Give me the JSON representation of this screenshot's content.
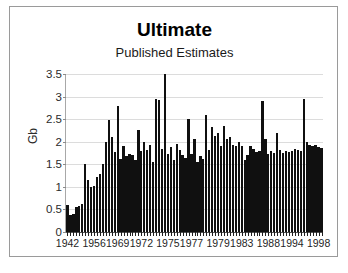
{
  "chart_data": {
    "type": "bar",
    "title": "Ultimate",
    "subtitle": "Published Estimates",
    "xlabel": "",
    "ylabel": "Gb",
    "ylim": [
      0,
      3.5
    ],
    "yticks": [
      0,
      0.5,
      1,
      1.5,
      2,
      2.5,
      3,
      3.5
    ],
    "ytick_labels": [
      "0",
      "0.5",
      "1",
      "1.5",
      "2",
      "2.5",
      "3",
      "3.5"
    ],
    "grid": true,
    "legend": "none",
    "xtick_labels": [
      "1942",
      "1956",
      "1969",
      "1972",
      "1975",
      "1977",
      "1979",
      "1983",
      "1988",
      "1994",
      "1998"
    ],
    "xtick_indices": [
      0,
      9,
      17,
      25,
      34,
      42,
      51,
      59,
      68,
      76,
      85
    ],
    "categories": [
      "1942",
      "1944",
      "1946",
      "1948",
      "1950",
      "1952",
      "1954",
      "1955",
      "1956",
      "1956",
      "1957",
      "1958",
      "1959",
      "1960",
      "1962",
      "1964",
      "1966",
      "1969",
      "1969",
      "1970",
      "1970",
      "1971",
      "1971",
      "1972",
      "1972",
      "1972",
      "1973",
      "1973",
      "1974",
      "1974",
      "1975",
      "1975",
      "1975",
      "1975",
      "1975",
      "1976",
      "1976",
      "1976",
      "1976",
      "1977",
      "1977",
      "1977",
      "1977",
      "1977",
      "1978",
      "1978",
      "1978",
      "1979",
      "1979",
      "1979",
      "1979",
      "1979",
      "1980",
      "1981",
      "1981",
      "1982",
      "1982",
      "1983",
      "1983",
      "1983",
      "1984",
      "1984",
      "1985",
      "1986",
      "1987",
      "1988",
      "1988",
      "1988",
      "1988",
      "1989",
      "1990",
      "1991",
      "1992",
      "1993",
      "1994",
      "1994",
      "1994",
      "1995",
      "1995",
      "1996",
      "1996",
      "1997",
      "1997",
      "1998",
      "1998",
      "1999",
      "1999"
    ],
    "values": [
      0.6,
      0.38,
      0.4,
      0.55,
      0.58,
      0.62,
      1.5,
      1.15,
      1.0,
      1.02,
      1.22,
      1.28,
      1.5,
      2.0,
      2.48,
      2.1,
      1.78,
      2.8,
      1.62,
      1.9,
      1.68,
      1.72,
      1.7,
      1.6,
      2.25,
      1.8,
      2.0,
      1.82,
      1.92,
      1.55,
      2.95,
      2.92,
      1.85,
      3.5,
      1.72,
      1.88,
      1.6,
      1.95,
      1.82,
      1.7,
      1.65,
      2.5,
      1.72,
      2.05,
      1.55,
      1.68,
      1.62,
      2.6,
      1.82,
      2.32,
      2.12,
      2.2,
      1.9,
      2.35,
      2.05,
      2.1,
      1.92,
      1.9,
      2.0,
      1.9,
      1.6,
      1.7,
      1.9,
      1.85,
      1.78,
      1.8,
      2.9,
      2.05,
      1.72,
      1.8,
      1.75,
      2.2,
      1.82,
      1.75,
      1.8,
      1.78,
      1.8,
      1.85,
      1.82,
      1.8,
      2.95,
      2.0,
      1.92,
      1.9,
      1.92,
      1.88,
      1.86
    ]
  }
}
